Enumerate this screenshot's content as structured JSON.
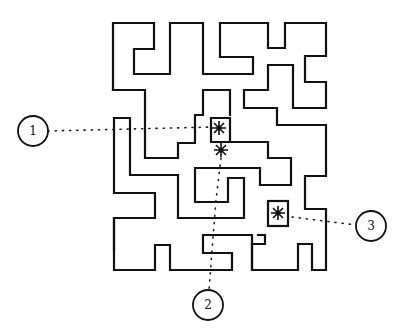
{
  "diagram": {
    "type": "maze",
    "colors": {
      "line": "#111111",
      "background": "#ffffff"
    },
    "callouts": [
      {
        "id": 1,
        "label": "1",
        "cx": 33,
        "cy": 131
      },
      {
        "id": 2,
        "label": "2",
        "cx": 208,
        "cy": 305
      },
      {
        "id": 3,
        "label": "3",
        "cx": 371,
        "cy": 226
      }
    ],
    "markers": [
      {
        "name": "star-marker-1",
        "x": 219,
        "y": 128,
        "boxed": false
      },
      {
        "name": "star-marker-2",
        "x": 221,
        "y": 150,
        "boxed": false
      },
      {
        "name": "star-marker-3",
        "x": 278,
        "y": 213,
        "boxed": true
      }
    ]
  }
}
